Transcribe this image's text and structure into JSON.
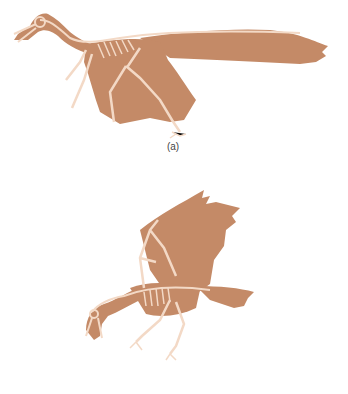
{
  "figure": {
    "colors": {
      "silhouette": "#c48a67",
      "bone": "#f3d9c6",
      "background": "#ffffff",
      "label_text": "#444444"
    },
    "panels": [
      {
        "id": "a",
        "label": "(a)",
        "subject": "skeleton-silhouette-gliding-pose"
      },
      {
        "id": "b",
        "label": "(b)",
        "subject": "skeleton-silhouette-wings-raised-pose"
      }
    ]
  }
}
